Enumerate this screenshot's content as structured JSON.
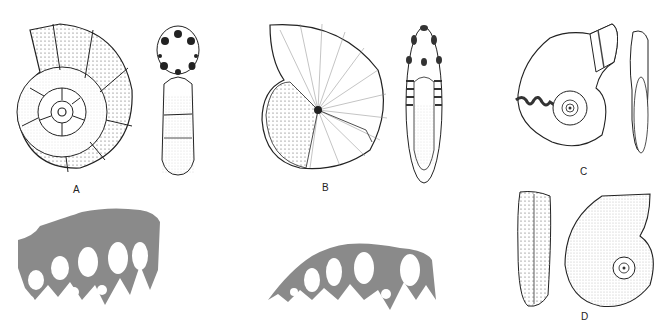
{
  "figure": {
    "panels": [
      {
        "id": "A",
        "label": "A",
        "description": "Ammonoid shell with ribbed whorls and spines, lateral and apertural views"
      },
      {
        "id": "B",
        "label": "B",
        "description": "Involute nautiloid-like shell with radial striae, lateral and apertural views"
      },
      {
        "id": "C",
        "label": "C",
        "description": "Smooth involute shell with exposed suture, lateral and ventral views"
      },
      {
        "id": "D",
        "label": "D",
        "description": "Finely ornamented shell, ventral and lateral views"
      }
    ],
    "sutures": [
      {
        "id": "suture-1",
        "description": "Gray silhouette of ammonitic suture pattern with frilled saddles"
      },
      {
        "id": "suture-2",
        "description": "Gray silhouette of ammonitic suture pattern with frilled saddles"
      }
    ],
    "colors": {
      "ink": "#222222",
      "silhouette": "#8a8a8a",
      "background": "#ffffff"
    }
  }
}
